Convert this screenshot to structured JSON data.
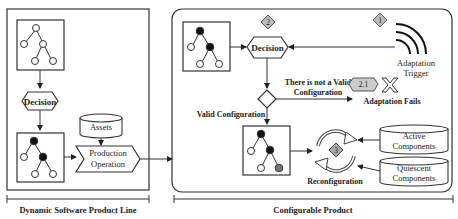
{
  "left_panel": {
    "title": "Dynamic Software Product Line",
    "decision_label": "Decision",
    "assets_label": "Assets",
    "production_label_line1": "Production",
    "production_label_line2": "Operation"
  },
  "right_panel": {
    "title": "Configurable Product",
    "decision_label": "Decision",
    "step_2": "2",
    "step_1": "1",
    "step_2_1": "2.1",
    "step_3": "3",
    "trigger_line1": "Adaptation",
    "trigger_line2": "Trigger",
    "invalid_line1": "There is not a Valid",
    "invalid_line2": "Configuration",
    "fails_label": "Adaptation Fails",
    "valid_label": "Valid Configuration",
    "active_line1": "Active",
    "active_line2": "Components",
    "quiescent_line1": "Quiescent",
    "quiescent_line2": "Components",
    "reconfig_label": "Reconfiguration"
  },
  "icons": {
    "feature_tree": "feature-tree-icon",
    "signal": "wireless-signal-icon",
    "fail": "x-cross-icon",
    "cycle": "cycle-arrows-icon",
    "database": "database-cylinder-icon"
  }
}
